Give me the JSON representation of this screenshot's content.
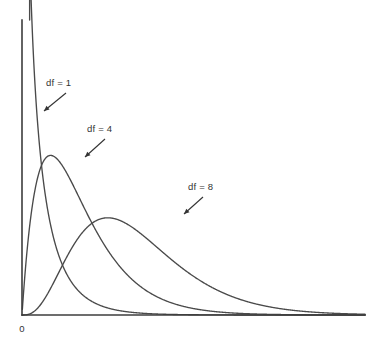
{
  "figure": {
    "background_color": "#ffffff",
    "curve_color": "#4a4a4a",
    "axis_color": "#3d3d3d",
    "text_color": "#333333"
  },
  "axes": {
    "origin_label": "0",
    "x_axis_name": "horizontal-axis",
    "y_axis_name": "vertical-axis",
    "x_label": "",
    "y_label": ""
  },
  "annotations": [
    {
      "label": "df = 1",
      "text_x": 46,
      "text_y": 86,
      "arrow_from_x": 66,
      "arrow_from_y": 93,
      "arrow_to_x": 44,
      "arrow_to_y": 111
    },
    {
      "label": "df = 4",
      "text_x": 87,
      "text_y": 132,
      "arrow_from_x": 105,
      "arrow_from_y": 139,
      "arrow_to_x": 85,
      "arrow_to_y": 157
    },
    {
      "label": "df = 8",
      "text_x": 188,
      "text_y": 190,
      "arrow_from_x": 203,
      "arrow_from_y": 197,
      "arrow_to_x": 184,
      "arrow_to_y": 214
    }
  ],
  "chart_data": {
    "type": "line",
    "title": "",
    "subtitle": "",
    "xlabel": "",
    "ylabel": "",
    "grid": false,
    "legend_position": "inline-annotations",
    "xlim": [
      0,
      24
    ],
    "ylim": [
      0,
      0.34
    ],
    "x_tick_labels": [
      "0"
    ],
    "y_tick_labels": [],
    "distribution": "chi-square probability density",
    "x": [
      0.05,
      0.2,
      0.4,
      0.6,
      0.8,
      1,
      1.25,
      1.5,
      1.75,
      2,
      2.5,
      3,
      3.5,
      4,
      4.5,
      5,
      5.5,
      6,
      7,
      8,
      9,
      10,
      11,
      12,
      13,
      14,
      15,
      16,
      17,
      18,
      19,
      20,
      21,
      22,
      23,
      24
    ],
    "series": [
      {
        "name": "df = 1",
        "df": 1,
        "values": [
          1.7724,
          0.844,
          0.5717,
          0.449,
          0.3749,
          0.242,
          0.1826,
          0.1427,
          0.1142,
          0.093,
          0.0641,
          0.0456,
          0.0332,
          0.0247,
          0.0186,
          0.0142,
          0.0109,
          0.0085,
          0.0052,
          0.0033,
          0.0021,
          0.0013,
          0.0009,
          0.0006,
          0.0004,
          0.0003,
          0.0002,
          0.0001,
          0.0001,
          0.0,
          0.0,
          0.0,
          0.0,
          0.0,
          0.0,
          0.0
        ]
      },
      {
        "name": "df = 4",
        "df": 4,
        "values": [
          0.0061,
          0.0226,
          0.0409,
          0.0556,
          0.067,
          0.1516,
          0.1674,
          0.1771,
          0.1822,
          0.1839,
          0.1791,
          0.1673,
          0.1521,
          0.1353,
          0.1185,
          0.1026,
          0.0879,
          0.0747,
          0.0528,
          0.0366,
          0.025,
          0.0168,
          0.0112,
          0.0074,
          0.0049,
          0.0032,
          0.0021,
          0.0013,
          0.0009,
          0.0006,
          0.0004,
          0.0002,
          0.0001,
          0.0001,
          0.0001,
          0.0
        ]
      },
      {
        "name": "df = 8",
        "df": 8,
        "values": [
          0.0,
          0.0,
          0.0,
          0.0001,
          0.0002,
          0.0016,
          0.0036,
          0.0068,
          0.0113,
          0.0153,
          0.0278,
          0.0417,
          0.0551,
          0.0667,
          0.0758,
          0.0818,
          0.0848,
          0.0852,
          0.08,
          0.0687,
          0.0551,
          0.0419,
          0.0306,
          0.0217,
          0.015,
          0.0102,
          0.0068,
          0.0045,
          0.0029,
          0.0018,
          0.0012,
          0.0007,
          0.0005,
          0.0003,
          0.0002,
          0.0001
        ]
      }
    ]
  },
  "plot_geometry": {
    "origin_px_x": 22,
    "origin_px_y": 315,
    "x_axis_right_px": 365,
    "y_axis_top_px": 20
  }
}
